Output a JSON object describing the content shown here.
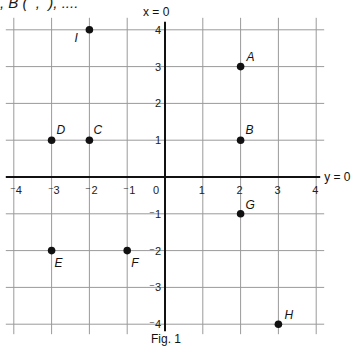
{
  "header": {
    "text": ", B (  ,  ), ...."
  },
  "chart_data": {
    "type": "scatter",
    "title": "",
    "caption": "Fig. 1",
    "xlabel": "y = 0",
    "ylabel": "x = 0",
    "xlim": [
      -4,
      4
    ],
    "ylim": [
      -4,
      4
    ],
    "grid": true,
    "x_ticks": [
      "-4",
      "-3",
      "-2",
      "-1",
      "0",
      "1",
      "2",
      "3",
      "4"
    ],
    "y_ticks": [
      "4",
      "3",
      "2",
      "1",
      "-1",
      "-2",
      "-3",
      "-4"
    ],
    "points": [
      {
        "label": "A",
        "x": 2,
        "y": 3
      },
      {
        "label": "B",
        "x": 2,
        "y": 1
      },
      {
        "label": "C",
        "x": -2,
        "y": 1
      },
      {
        "label": "D",
        "x": -3,
        "y": 1
      },
      {
        "label": "E",
        "x": -3,
        "y": -2
      },
      {
        "label": "F",
        "x": -1,
        "y": -2
      },
      {
        "label": "G",
        "x": 2,
        "y": -1
      },
      {
        "label": "H",
        "x": 3,
        "y": -4
      },
      {
        "label": "I",
        "x": -2,
        "y": 4
      }
    ]
  }
}
